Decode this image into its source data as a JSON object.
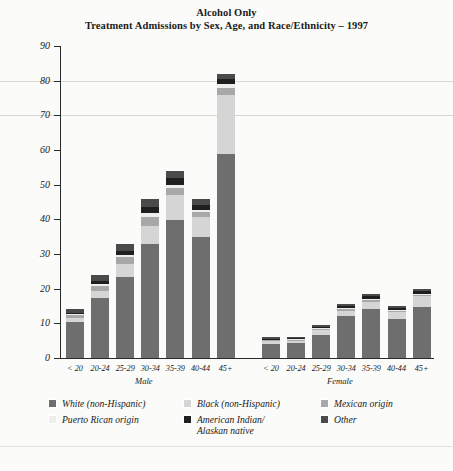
{
  "title": {
    "line1": "Alcohol Only",
    "line2": "Treatment Admissions by Sex, Age, and Race/Ethnicity – 1997"
  },
  "axis": {
    "y_title": "Thousands",
    "y_ticks": [
      "90",
      "80",
      "70",
      "60",
      "50",
      "40",
      "30",
      "20",
      "10",
      "0"
    ],
    "group_labels": [
      "Male",
      "Female"
    ],
    "x_categories": [
      "< 20",
      "20-24",
      "25-29",
      "30-34",
      "35-39",
      "40-44",
      "45+"
    ]
  },
  "legend": {
    "items": [
      {
        "label": "White (non-Hispanic)",
        "label2": "",
        "color": "#6e6e6e"
      },
      {
        "label": "Black (non-Hispanic)",
        "label2": "",
        "color": "#d5d5d5"
      },
      {
        "label": "Mexican origin",
        "label2": "",
        "color": "#a8a8a8"
      },
      {
        "label": "Puerto Rican origin",
        "label2": "",
        "color": "#eeeeee"
      },
      {
        "label": "American Indian/",
        "label2": "Alaskan native",
        "color": "#1f1f1f"
      },
      {
        "label": "Other",
        "label2": "",
        "color": "#4a4a4a"
      }
    ]
  },
  "chart_data": {
    "type": "bar",
    "subtype": "stacked",
    "xlabel": "",
    "ylabel": "Thousands",
    "ylim": [
      0,
      90
    ],
    "ytick_step": 10,
    "grid": true,
    "legend_position": "bottom",
    "groups": [
      "Male",
      "Female"
    ],
    "categories": [
      "< 20",
      "20-24",
      "25-29",
      "30-34",
      "35-39",
      "40-44",
      "45+"
    ],
    "series": [
      {
        "name": "White (non-Hispanic)",
        "color": "#6e6e6e",
        "values_male": [
          10.3,
          17.4,
          23.5,
          33.0,
          39.8,
          35.0,
          58.8
        ],
        "values_female": [
          4.0,
          4.2,
          6.6,
          12.2,
          14.0,
          11.3,
          14.8
        ]
      },
      {
        "name": "Black (non-Hispanic)",
        "color": "#d5d5d5",
        "values_male": [
          1.2,
          2.0,
          3.6,
          5.2,
          7.2,
          5.8,
          17.1
        ],
        "values_female": [
          0.9,
          0.8,
          1.5,
          1.5,
          2.3,
          2.0,
          3.2
        ]
      },
      {
        "name": "Mexican origin",
        "color": "#a8a8a8",
        "values_male": [
          0.8,
          1.4,
          1.9,
          2.4,
          2.0,
          1.2,
          2.0
        ],
        "values_female": [
          0.3,
          0.3,
          0.3,
          0.4,
          0.4,
          0.3,
          0.3
        ]
      },
      {
        "name": "Puerto Rican origin",
        "color": "#eeeeee",
        "values_male": [
          0.3,
          0.5,
          0.7,
          1.1,
          1.0,
          0.6,
          1.1
        ],
        "values_female": [
          0.1,
          0.1,
          0.2,
          0.2,
          0.3,
          0.2,
          0.2
        ]
      },
      {
        "name": "American Indian/Alaskan native",
        "color": "#1f1f1f",
        "values_male": [
          0.5,
          0.9,
          1.3,
          2.0,
          2.0,
          1.6,
          1.4
        ],
        "values_female": [
          0.3,
          0.3,
          0.4,
          0.6,
          0.8,
          0.6,
          0.7
        ]
      },
      {
        "name": "Other",
        "color": "#4a4a4a",
        "values_male": [
          0.9,
          1.8,
          2.0,
          2.3,
          2.0,
          1.8,
          1.6
        ],
        "values_female": [
          0.4,
          0.3,
          0.5,
          0.6,
          0.7,
          0.6,
          0.6
        ]
      }
    ],
    "totals_male": [
      14.0,
      24.0,
      33.0,
      46.0,
      54.0,
      46.0,
      82.0
    ],
    "totals_female": [
      6.0,
      6.0,
      9.5,
      15.5,
      18.5,
      15.0,
      19.8
    ]
  }
}
